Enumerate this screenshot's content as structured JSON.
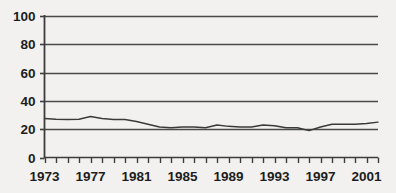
{
  "chart_data": {
    "type": "line",
    "title": "",
    "xlabel": "",
    "ylabel": "",
    "xlim": [
      1973,
      2002
    ],
    "ylim": [
      0,
      100
    ],
    "grid": true,
    "legend": null,
    "y_ticks": [
      0,
      20,
      40,
      60,
      80,
      100
    ],
    "y_tick_labels": [
      "0",
      "20",
      "40",
      "60",
      "80",
      "100"
    ],
    "x_tick_labels": [
      "1973",
      "1977",
      "1981",
      "1985",
      "1989",
      "1993",
      "1997",
      "2001"
    ],
    "x_tick_label_years": [
      1973,
      1977,
      1981,
      1985,
      1989,
      1993,
      1997,
      2001
    ],
    "x_minor_ticks": [
      1973,
      1974,
      1975,
      1976,
      1977,
      1978,
      1979,
      1980,
      1981,
      1982,
      1983,
      1984,
      1985,
      1986,
      1987,
      1988,
      1989,
      1990,
      1991,
      1992,
      1993,
      1994,
      1995,
      1996,
      1997,
      1998,
      1999,
      2000,
      2001,
      2002
    ],
    "x": [
      1973,
      1974,
      1975,
      1976,
      1977,
      1978,
      1979,
      1980,
      1981,
      1982,
      1983,
      1984,
      1985,
      1986,
      1987,
      1988,
      1989,
      1990,
      1991,
      1992,
      1993,
      1994,
      1995,
      1996,
      1997,
      1998,
      1999,
      2000,
      2001,
      2002
    ],
    "values": [
      27.5,
      27.0,
      26.8,
      27.0,
      29.0,
      27.5,
      26.8,
      26.8,
      25.5,
      23.5,
      21.5,
      21.0,
      21.5,
      21.5,
      21.0,
      23.0,
      22.0,
      21.5,
      21.5,
      23.0,
      22.5,
      21.0,
      21.0,
      19.0,
      21.5,
      23.5,
      23.5,
      23.5,
      24.0,
      25.0
    ],
    "series": [
      {
        "name": "series-1",
        "values": [
          27.5,
          27.0,
          26.8,
          27.0,
          29.0,
          27.5,
          26.8,
          26.8,
          25.5,
          23.5,
          21.5,
          21.0,
          21.5,
          21.5,
          21.0,
          23.0,
          22.0,
          21.5,
          21.5,
          23.0,
          22.5,
          21.0,
          21.0,
          19.0,
          21.5,
          23.5,
          23.5,
          23.5,
          24.0,
          25.0
        ],
        "color": "#3a3a3a"
      }
    ],
    "colors": {
      "background": "#f2f1ef",
      "axis": "#3d3d3d",
      "gridline": "#4a4a4a",
      "line": "#3a3a3a",
      "text": "#1d1d1d"
    }
  }
}
